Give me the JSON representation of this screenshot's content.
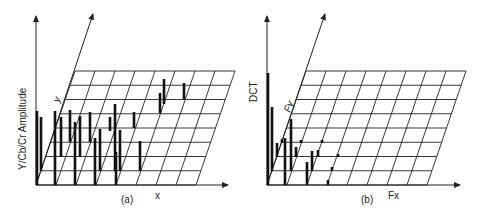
{
  "panel_a": {
    "caption": "(a)",
    "vertical_axis_label": "Y/Cb/Cr Amplitude",
    "depth_axis_label": "y",
    "horizontal_axis_label": "x",
    "grid": {
      "cols": 8,
      "rows": 8
    }
  },
  "panel_b": {
    "caption": "(b)",
    "vertical_axis_label": "DCT",
    "depth_axis_label": "Fy",
    "horizontal_axis_label": "Fx",
    "grid": {
      "cols": 8,
      "rows": 8
    }
  },
  "colors": {
    "line": "#222222",
    "background": "#ffffff"
  }
}
